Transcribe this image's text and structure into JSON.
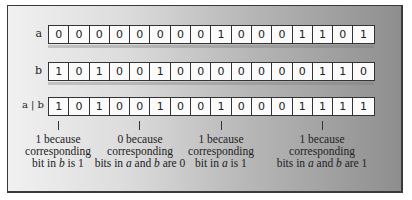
{
  "diagram": {
    "rows": [
      {
        "label": "a",
        "bits": [
          "0",
          "0",
          "0",
          "0",
          "0",
          "0",
          "0",
          "0",
          "1",
          "0",
          "0",
          "0",
          "1",
          "1",
          "0",
          "1"
        ]
      },
      {
        "label": "b",
        "bits": [
          "1",
          "0",
          "1",
          "0",
          "0",
          "1",
          "0",
          "0",
          "0",
          "0",
          "0",
          "0",
          "0",
          "1",
          "1",
          "0"
        ]
      },
      {
        "label": "a | b",
        "bits": [
          "1",
          "0",
          "1",
          "0",
          "0",
          "1",
          "0",
          "0",
          "1",
          "0",
          "0",
          "0",
          "1",
          "1",
          "1",
          "1"
        ]
      }
    ],
    "annotations": [
      {
        "bit_index": 0,
        "line1": "1 because",
        "line2": "corresponding",
        "line3_pre": "bit in ",
        "line3_var1": "b",
        "line3_mid": " is 1",
        "line3_var2": "",
        "line3_post": ""
      },
      {
        "bit_index": 4,
        "line1": "0 because",
        "line2": "corresponding",
        "line3_pre": "bits in ",
        "line3_var1": "a",
        "line3_mid": " and ",
        "line3_var2": "b",
        "line3_post": " are 0"
      },
      {
        "bit_index": 8,
        "line1": "1 because",
        "line2": "corresponding",
        "line3_pre": "bit in ",
        "line3_var1": "a",
        "line3_mid": " is 1",
        "line3_var2": "",
        "line3_post": ""
      },
      {
        "bit_index": 13,
        "line1": "1 because",
        "line2": "corresponding",
        "line3_pre": "bits in ",
        "line3_var1": "a",
        "line3_mid": " and ",
        "line3_var2": "b",
        "line3_post": " are 1"
      }
    ]
  }
}
